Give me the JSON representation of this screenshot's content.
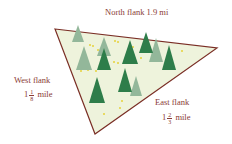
{
  "diagram": {
    "sides": {
      "north": {
        "label": "North flank 1.9 mi"
      },
      "west": {
        "label": "West flank",
        "whole": "1",
        "num": "1",
        "den": "8",
        "unit": "mile"
      },
      "east": {
        "label": "East flank",
        "whole": "1",
        "num": "2",
        "den": "3",
        "unit": "mile"
      }
    },
    "colors": {
      "border": "#7a2e25",
      "fill": "#eef3dc",
      "tree_dark": "#2e7d4a",
      "tree_light": "#93b79a",
      "flowers": "#e6d23a",
      "text": "#8a3b35"
    }
  }
}
